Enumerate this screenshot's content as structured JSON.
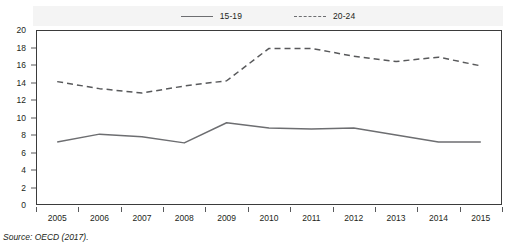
{
  "chart_data": {
    "type": "line",
    "title": "",
    "xlabel": "",
    "ylabel": "",
    "categories": [
      "2005",
      "2006",
      "2007",
      "2008",
      "2009",
      "2010",
      "2011",
      "2012",
      "2013",
      "2014",
      "2015"
    ],
    "ylim": [
      0,
      20
    ],
    "y_ticks": [
      0,
      2,
      4,
      6,
      8,
      10,
      12,
      14,
      16,
      18,
      20
    ],
    "grid": false,
    "legend_position": "top-center",
    "series": [
      {
        "name": "15-19",
        "style": "solid",
        "color": "#6d6e71",
        "values": [
          7.2,
          8.1,
          7.8,
          7.1,
          9.4,
          8.8,
          8.7,
          8.8,
          8.0,
          7.2,
          7.2
        ]
      },
      {
        "name": "20-24",
        "style": "dashed",
        "color": "#58595b",
        "values": [
          14.1,
          13.3,
          12.8,
          13.6,
          14.2,
          17.9,
          17.9,
          17.0,
          16.4,
          16.9,
          15.9
        ]
      }
    ]
  },
  "legend": {
    "entries": [
      {
        "label": "15-19",
        "style": "solid"
      },
      {
        "label": "20-24",
        "style": "dashed"
      }
    ]
  },
  "source": {
    "text": "Source: OECD (2017)."
  }
}
